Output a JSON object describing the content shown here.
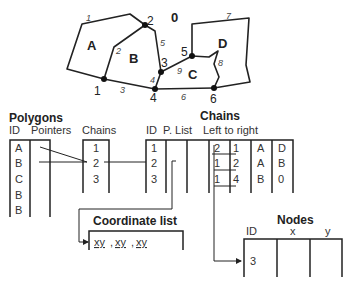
{
  "map": {
    "outside_label": "0",
    "polygons": [
      "A",
      "B",
      "C",
      "D"
    ],
    "nodes": [
      {
        "id": "1",
        "x": 104,
        "y": 79
      },
      {
        "id": "2",
        "x": 145,
        "y": 25
      },
      {
        "id": "3",
        "x": 161,
        "y": 72
      },
      {
        "id": "4",
        "x": 155,
        "y": 89
      },
      {
        "id": "5",
        "x": 192,
        "y": 56
      },
      {
        "id": "6",
        "x": 214,
        "y": 88
      }
    ],
    "chain_labels": [
      "1",
      "2",
      "3",
      "4",
      "5",
      "6",
      "7",
      "8",
      "9"
    ]
  },
  "polygons_table": {
    "title": "Polygons",
    "headers": [
      "ID",
      "Pointers",
      "Chains"
    ],
    "ids": [
      "A",
      "B",
      "C",
      "B",
      "B"
    ],
    "chains": [
      "1",
      "2",
      "3"
    ]
  },
  "chains_table": {
    "title": "Chains",
    "headers": [
      "ID",
      "P. List",
      "Left to right"
    ],
    "rows": [
      {
        "id": "1",
        "from": "2",
        "to": "1",
        "left": "A",
        "right": "D"
      },
      {
        "id": "2",
        "from": "1",
        "to": "2",
        "left": "A",
        "right": "B"
      },
      {
        "id": "3",
        "from": "1",
        "to": "4",
        "left": "B",
        "right": "0"
      }
    ]
  },
  "coordinate_list": {
    "title": "Coordinate list",
    "values": [
      "xy",
      "xy",
      "xy"
    ]
  },
  "nodes_table": {
    "title": "Nodes",
    "headers": [
      "ID",
      "x",
      "y"
    ],
    "rows": [
      {
        "id": "3"
      }
    ]
  }
}
